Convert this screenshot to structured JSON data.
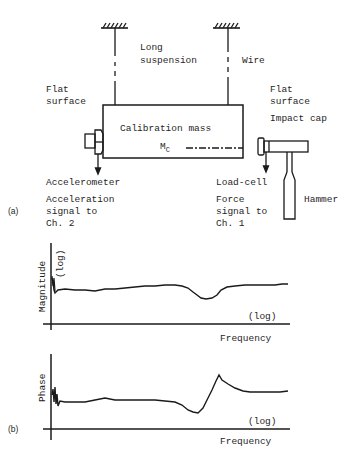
{
  "diagram": {
    "panel_a": {
      "tag": "(a)",
      "suspension_label_line1": "Long",
      "suspension_label_line2": "suspension",
      "wire_label": "Wire",
      "flat_surface_left_line1": "Flat",
      "flat_surface_left_line2": "surface",
      "flat_surface_right_line1": "Flat",
      "flat_surface_right_line2": "surface",
      "impact_cap_label": "Impact cap",
      "mass_label": "Calibration mass",
      "mass_symbol": "M",
      "mass_symbol_subscript": "C",
      "accelerometer_label": "Accelerometer",
      "acceleration_signal_line1": "Acceleration",
      "acceleration_signal_line2": "signal to",
      "acceleration_signal_line3": "Ch. 2",
      "load_cell_label": "Load-cell",
      "force_signal_line1": "Force",
      "force_signal_line2": "signal to",
      "force_signal_line3": "Ch. 1",
      "hammer_label": "Hammer"
    },
    "panel_b": {
      "tag": "(b)",
      "magnitude_plot": {
        "ylabel": "Magnitude",
        "ylabel_scale": "(log)",
        "xlabel": "Frequency",
        "xlabel_scale": "(log)"
      },
      "phase_plot": {
        "ylabel": "Phase",
        "xlabel": "Frequency",
        "xlabel_scale": "(log)"
      }
    },
    "colors": {
      "ink": "#1a1a1a",
      "background": "#ffffff"
    }
  }
}
